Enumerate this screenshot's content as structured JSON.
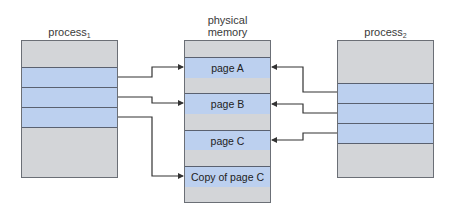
{
  "diagram": {
    "process1": {
      "label": "process",
      "subscript": "1",
      "shared_pages": 3
    },
    "process2": {
      "label": "process",
      "subscript": "2",
      "shared_pages": 3
    },
    "memory": {
      "label_line1": "physical",
      "label_line2": "memory",
      "rows": [
        {
          "type": "free",
          "text": ""
        },
        {
          "type": "page",
          "text": "page A"
        },
        {
          "type": "free",
          "text": ""
        },
        {
          "type": "page",
          "text": "page B"
        },
        {
          "type": "free",
          "text": ""
        },
        {
          "type": "page",
          "text": "page C"
        },
        {
          "type": "free",
          "text": ""
        },
        {
          "type": "page",
          "text": "Copy of page C"
        },
        {
          "type": "free",
          "text": ""
        }
      ]
    },
    "mappings": [
      {
        "from": "process1",
        "band": 1,
        "to": "page A"
      },
      {
        "from": "process1",
        "band": 2,
        "to": "page B"
      },
      {
        "from": "process1",
        "band": 3,
        "to": "Copy of page C"
      },
      {
        "from": "process2",
        "band": 1,
        "to": "page A"
      },
      {
        "from": "process2",
        "band": 2,
        "to": "page B"
      },
      {
        "from": "process2",
        "band": 3,
        "to": "page C"
      }
    ],
    "colors": {
      "page_fill": "#bcd0ef",
      "free_fill": "#d3d5d8",
      "border": "#5a6170",
      "arrow": "#333333"
    }
  }
}
